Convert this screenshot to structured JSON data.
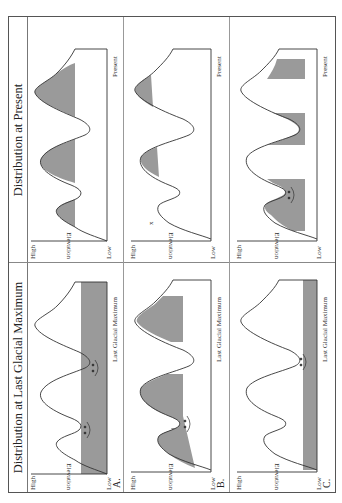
{
  "columns": {
    "left_title": "Distribution at Last Glacial Maximum",
    "right_title": "Distribution at Present"
  },
  "axis": {
    "high": "High",
    "ylabel": "Elevation",
    "low": "Low",
    "lgm_xlabel": "Last Glacial Maximum",
    "present_xlabel": "Present"
  },
  "rows": [
    {
      "label": "A.",
      "lgm": {
        "fill": "lower band shaded up to mid elevation across all valleys",
        "markers": "arrows pointing toward each other in two valleys"
      },
      "present": {
        "fill": "shaded caps on all three peaks"
      }
    },
    {
      "label": "B.",
      "lgm": {
        "fill": "shaded band on flanks of each peak at mid-high elevation; valley floors unshaded",
        "markers": "arrows in one valley"
      },
      "present": {
        "fill": "small shaded caps on two peaks",
        "markers": "x marks extinct population on left peak"
      }
    },
    {
      "label": "C.",
      "lgm": {
        "fill": "narrow shaded band at lowest elevation",
        "markers": "arrows in one valley"
      },
      "present": {
        "fill": "wide mid-elevation band across flanks",
        "markers": "arrows in one valley"
      }
    }
  ],
  "colors": {
    "fill": "#9a9a9a",
    "line": "#333333",
    "border": "#555555"
  }
}
